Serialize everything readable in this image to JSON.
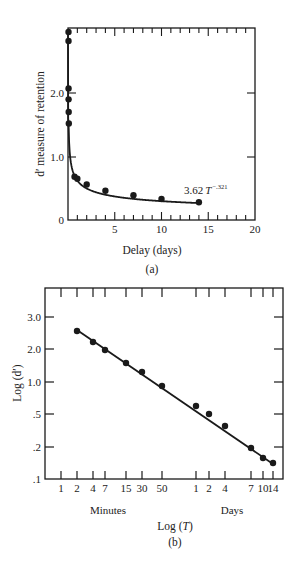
{
  "chart_data": [
    {
      "panel": "(a)",
      "type": "line",
      "title": "",
      "xlabel": "Delay (days)",
      "ylabel": "d' measure of retention",
      "xlim": [
        0,
        20
      ],
      "ylim": [
        0,
        3.0
      ],
      "xticks": [
        5,
        10,
        15,
        20
      ],
      "xtick_labels": [
        "5",
        "10",
        "15",
        "20"
      ],
      "yticks": [
        0,
        1.0,
        2.0
      ],
      "ytick_labels": [
        "0",
        "1.0",
        "2.0"
      ],
      "grid": false,
      "annotation": {
        "text": "3.62 T",
        "superscript": "−.321",
        "x": 11.5,
        "y": 0.45
      },
      "series": [
        {
          "name": "observed",
          "x": [
            0.001,
            0.003,
            0.005,
            0.01,
            0.02,
            0.035,
            0.7,
            1,
            2,
            4,
            7,
            10,
            14
          ],
          "values": [
            2.96,
            2.82,
            2.07,
            1.9,
            1.7,
            1.52,
            0.68,
            0.65,
            0.56,
            0.46,
            0.39,
            0.33,
            0.28
          ]
        },
        {
          "name": "fit 3.62 T^-.321",
          "x": [
            0.035,
            0.1,
            0.3,
            0.7,
            1,
            2,
            4,
            7,
            10,
            14
          ],
          "values": [
            1.5,
            1.15,
            0.85,
            0.7,
            0.62,
            0.55,
            0.46,
            0.39,
            0.34,
            0.28
          ]
        }
      ]
    },
    {
      "panel": "(b)",
      "type": "scatter",
      "title": "",
      "xlabel": "Log (T)",
      "ylabel": "Log (d')",
      "xtick_labels": [
        "1",
        "2",
        "4",
        "7",
        "15",
        "30",
        "50",
        "1",
        "2",
        "4",
        "7",
        "10",
        "14"
      ],
      "xgroup_labels": [
        "Minutes",
        "Days"
      ],
      "ytick_labels": [
        ".1",
        ".2",
        ".5",
        "1.0",
        "2.0",
        "3.0"
      ],
      "yticks": [
        0.1,
        0.2,
        0.5,
        1.0,
        2.0,
        3.0
      ],
      "grid": false,
      "series": [
        {
          "name": "observed",
          "x": [
            "2 min",
            "4 min",
            "7 min",
            "15 min",
            "30 min",
            "50 min",
            "1 day",
            "2 days",
            "4 days",
            "7 days",
            "10 days",
            "14 days"
          ],
          "values": [
            2.6,
            2.25,
            2.0,
            1.6,
            1.35,
            0.9,
            0.62,
            0.5,
            0.35,
            0.19,
            0.16,
            0.145
          ]
        },
        {
          "name": "linear fit",
          "x": [
            "2 min",
            "14 days"
          ],
          "values": [
            2.65,
            0.14
          ]
        }
      ]
    }
  ],
  "panel_a": {
    "caption": "(a)",
    "xlabel": "Delay (days)",
    "ylabel": "d′ measure of retention",
    "yticks": [
      {
        "label": "0",
        "y": 220
      },
      {
        "label": "1.0",
        "y": 157
      },
      {
        "label": "2.0",
        "y": 93
      }
    ],
    "xticks": [
      {
        "label": "5",
        "x": 114.8
      },
      {
        "label": "10",
        "x": 161.5
      },
      {
        "label": "15",
        "x": 208.2
      },
      {
        "label": "20",
        "x": 255
      }
    ],
    "annotation": "3.62",
    "annotation_var": "T",
    "annotation_exp": "−.321"
  },
  "panel_b": {
    "caption": "(b)",
    "xlabel": "Log (T)",
    "xlabel_prefix": "Log (",
    "xlabel_var": "T",
    "xlabel_suffix": ")",
    "ylabel": "Log (d′)",
    "group_minutes": "Minutes",
    "group_days": "Days",
    "yticks": [
      {
        "label": "3.0",
        "y": 317
      },
      {
        "label": "2.0",
        "y": 349
      },
      {
        "label": "1.0",
        "y": 382
      },
      {
        "label": ".5",
        "y": 414
      },
      {
        "label": ".2",
        "y": 447
      },
      {
        "label": ".1",
        "y": 479
      }
    ],
    "xticks": [
      {
        "label": "1",
        "x": 61
      },
      {
        "label": "2",
        "x": 77
      },
      {
        "label": "4",
        "x": 93
      },
      {
        "label": "7",
        "x": 105
      },
      {
        "label": "15",
        "x": 126
      },
      {
        "label": "30",
        "x": 142
      },
      {
        "label": "50",
        "x": 162
      },
      {
        "label": "1",
        "x": 196
      },
      {
        "label": "2",
        "x": 209
      },
      {
        "label": "4",
        "x": 225
      },
      {
        "label": "7",
        "x": 251
      },
      {
        "label": "10",
        "x": 263
      },
      {
        "label": "14",
        "x": 273
      }
    ]
  },
  "colors": {
    "ink": "#1a1a1a",
    "background": "#ffffff"
  }
}
